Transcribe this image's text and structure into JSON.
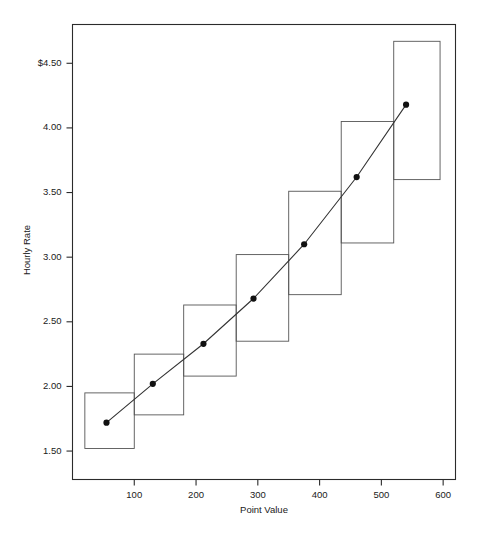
{
  "chart_data": {
    "type": "line",
    "title": "",
    "subtitle": "",
    "xlabel": "Point Value",
    "ylabel": "Hourly Rate",
    "xlim": [
      0,
      620
    ],
    "ylim": [
      1.28,
      4.8
    ],
    "grid": false,
    "legend": "none",
    "x_ticks": [
      100,
      200,
      300,
      400,
      500,
      600
    ],
    "x_tick_labels": [
      "100",
      "200",
      "300",
      "400",
      "500",
      "600"
    ],
    "y_ticks": [
      4.5,
      4.0,
      3.5,
      3.0,
      2.5,
      2.0,
      1.5
    ],
    "y_tick_labels": [
      "$4.50",
      "4.00",
      "3.50",
      "3.00",
      "2.50",
      "2.00",
      "1.50"
    ],
    "x": [
      55,
      130,
      212,
      293,
      375,
      460,
      540
    ],
    "values": [
      1.72,
      2.02,
      2.33,
      2.68,
      3.1,
      3.62,
      4.18
    ],
    "series": [
      {
        "name": "Hourly Rate",
        "marker": "filled-circle",
        "points": [
          {
            "x": 55,
            "y": 1.72
          },
          {
            "x": 130,
            "y": 2.02
          },
          {
            "x": 212,
            "y": 2.33
          },
          {
            "x": 293,
            "y": 2.68
          },
          {
            "x": 375,
            "y": 3.1
          },
          {
            "x": 460,
            "y": 3.62
          },
          {
            "x": 540,
            "y": 4.18
          }
        ]
      }
    ],
    "step_boxes": [
      {
        "x_start": 20,
        "x_end": 100,
        "y_low": 1.52,
        "y_high": 1.95
      },
      {
        "x_start": 100,
        "x_end": 180,
        "y_low": 1.78,
        "y_high": 2.25
      },
      {
        "x_start": 180,
        "x_end": 265,
        "y_low": 2.08,
        "y_high": 2.63
      },
      {
        "x_start": 265,
        "x_end": 350,
        "y_low": 2.35,
        "y_high": 3.02
      },
      {
        "x_start": 350,
        "x_end": 435,
        "y_low": 2.71,
        "y_high": 3.51
      },
      {
        "x_start": 435,
        "x_end": 520,
        "y_low": 3.11,
        "y_high": 4.05
      },
      {
        "x_start": 520,
        "x_end": 595,
        "y_low": 3.6,
        "y_high": 4.67
      }
    ]
  }
}
